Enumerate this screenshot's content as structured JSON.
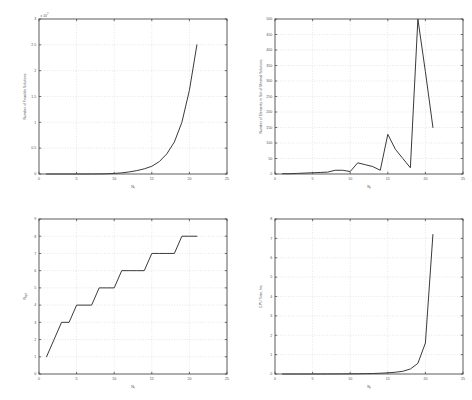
{
  "figure": {
    "background": "#ffffff",
    "curve_color": "#3a3a3a",
    "axis_color": "#4a4a4a",
    "grid_color": "#c8c8c8"
  },
  "chart_data": [
    {
      "id": "top-left",
      "type": "line",
      "title": "",
      "xlabel": "N",
      "xlabel_sub": "t",
      "ylabel": "Number of Feasible Solutions",
      "y_exponent_label": "x 10",
      "y_exponent_power": "7",
      "xlim": [
        0,
        25
      ],
      "ylim": [
        0,
        3
      ],
      "xticks": [
        0,
        5,
        10,
        15,
        20,
        25
      ],
      "yticks": [
        0,
        0.5,
        1,
        1.5,
        2,
        2.5,
        3
      ],
      "ytick_labels": [
        "0",
        "0.5",
        "1",
        "1.5",
        "2",
        "2.5",
        "3"
      ],
      "grid": true,
      "x": [
        1,
        2,
        3,
        4,
        5,
        6,
        7,
        8,
        9,
        10,
        11,
        12,
        13,
        14,
        15,
        16,
        17,
        18,
        19,
        20,
        21
      ],
      "y": [
        2e-07,
        8e-07,
        3e-06,
        1e-05,
        4e-05,
        0.00013,
        0.0004,
        0.0013,
        0.004,
        0.011,
        0.022,
        0.04,
        0.065,
        0.1,
        0.15,
        0.24,
        0.39,
        0.62,
        1.0,
        1.62,
        2.5
      ]
    },
    {
      "id": "top-right",
      "type": "line",
      "title": "",
      "xlabel": "N",
      "xlabel_sub": "t",
      "ylabel": "Number of Elements in Set of Minimal Solutions",
      "xlim": [
        0,
        25
      ],
      "ylim": [
        0,
        500
      ],
      "xticks": [
        0,
        5,
        10,
        15,
        20,
        25
      ],
      "yticks": [
        0,
        50,
        100,
        150,
        200,
        250,
        300,
        350,
        400,
        450,
        500
      ],
      "ytick_labels": [
        "0",
        "50",
        "100",
        "150",
        "200",
        "250",
        "300",
        "350",
        "400",
        "450",
        "500"
      ],
      "grid": true,
      "x": [
        1,
        2,
        3,
        4,
        5,
        6,
        7,
        8,
        9,
        10,
        11,
        12,
        13,
        14,
        15,
        16,
        17,
        18,
        19,
        20,
        21
      ],
      "y": [
        1,
        1,
        2,
        3,
        4,
        5,
        6,
        12,
        12,
        8,
        36,
        30,
        24,
        12,
        128,
        80,
        50,
        20,
        500,
        330,
        150
      ]
    },
    {
      "id": "bottom-left",
      "type": "line",
      "title": "",
      "xlabel": "N",
      "xlabel_sub": "t",
      "ylabel": "N",
      "ylabel_sub": "opt",
      "xlim": [
        0,
        25
      ],
      "ylim": [
        0,
        9
      ],
      "xticks": [
        0,
        5,
        10,
        15,
        20,
        25
      ],
      "yticks": [
        0,
        1,
        2,
        3,
        4,
        5,
        6,
        7,
        8,
        9
      ],
      "ytick_labels": [
        "0",
        "1",
        "2",
        "3",
        "4",
        "5",
        "6",
        "7",
        "8",
        "9"
      ],
      "grid": true,
      "x": [
        1,
        2,
        3,
        4,
        5,
        6,
        7,
        8,
        9,
        10,
        11,
        12,
        13,
        14,
        15,
        16,
        17,
        18,
        19,
        20,
        21
      ],
      "y": [
        1,
        2,
        3,
        3,
        4,
        4,
        4,
        5,
        5,
        5,
        6,
        6,
        6,
        6,
        7,
        7,
        7,
        7,
        8,
        8,
        8
      ]
    },
    {
      "id": "bottom-right",
      "type": "line",
      "title": "",
      "xlabel": "N",
      "xlabel_sub": "t",
      "ylabel": "CPU Time, hrs",
      "xlim": [
        0,
        25
      ],
      "ylim": [
        0,
        8
      ],
      "xticks": [
        0,
        5,
        10,
        15,
        20,
        25
      ],
      "yticks": [
        0,
        1,
        2,
        3,
        4,
        5,
        6,
        7,
        8
      ],
      "ytick_labels": [
        "0",
        "1",
        "2",
        "3",
        "4",
        "5",
        "6",
        "7",
        "8"
      ],
      "grid": true,
      "x": [
        1,
        2,
        3,
        4,
        5,
        6,
        7,
        8,
        9,
        10,
        11,
        12,
        13,
        14,
        15,
        16,
        17,
        18,
        19,
        20,
        21
      ],
      "y": [
        0.0001,
        0.0001,
        0.0002,
        0.0003,
        0.0005,
        0.001,
        0.002,
        0.003,
        0.005,
        0.008,
        0.012,
        0.018,
        0.026,
        0.04,
        0.06,
        0.09,
        0.14,
        0.26,
        0.55,
        1.6,
        7.2
      ]
    }
  ]
}
